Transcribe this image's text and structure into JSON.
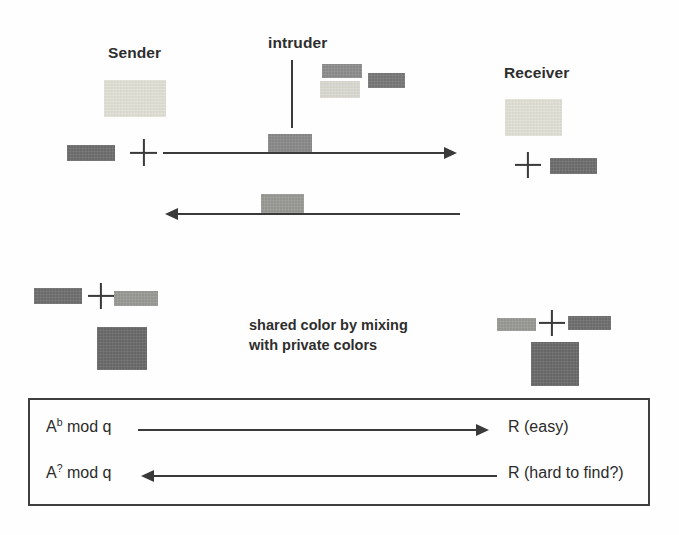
{
  "figure": {
    "labels": {
      "sender": "Sender",
      "intruder": "intruder",
      "receiver": "Receiver",
      "caption_line1": "shared color by mixing",
      "caption_line2": "with private colors"
    },
    "box": {
      "rows": [
        {
          "left": "A",
          "left_exponent": "b",
          "left_suffix": " mod q",
          "direction": "right",
          "right": "R (easy)"
        },
        {
          "left": "A",
          "left_exponent": "?",
          "left_suffix": " mod q",
          "direction": "left",
          "right": "R (hard to find?)"
        }
      ]
    },
    "colors": {
      "ink": "#3a3a3a",
      "box_border": "#3f3f3f",
      "background": "#fefefe",
      "sender_public_pale": "#e3e3d8",
      "sender_private_dark": "#6e6e6e",
      "intruder_bar_mid": "#8e8e8e",
      "intruder_bar_pale": "#dcdcd4",
      "intruder_bar_dark": "#787878",
      "transit_bar_up": "#8a8a8a",
      "transit_bar_down": "#9a9a96",
      "receiver_public_pale": "#e3e3d8",
      "receiver_private_dark": "#6e6e6e",
      "mix_left_dark": "#6f6f6f",
      "mix_left_mid": "#9a9a96",
      "mix_left_result": "#6a6a6a",
      "mix_right_mid": "#9a9a96",
      "mix_right_dark": "#6f6f6f",
      "mix_right_result": "#6a6a6a"
    },
    "swatches": [
      {
        "name": "sender-public-color-swatch",
        "x": 104,
        "y": 80,
        "w": 62,
        "h": 37,
        "color_key": "sender_public_pale"
      },
      {
        "name": "sender-private-color-swatch",
        "x": 67,
        "y": 145,
        "w": 48,
        "h": 16,
        "color_key": "sender_private_dark"
      },
      {
        "name": "intruder-captured-bar-1",
        "x": 322,
        "y": 64,
        "w": 40,
        "h": 14,
        "color_key": "intruder_bar_mid"
      },
      {
        "name": "intruder-captured-bar-2",
        "x": 320,
        "y": 81,
        "w": 40,
        "h": 17,
        "color_key": "intruder_bar_pale"
      },
      {
        "name": "intruder-captured-bar-3",
        "x": 368,
        "y": 73,
        "w": 37,
        "h": 15,
        "color_key": "intruder_bar_dark"
      },
      {
        "name": "transit-bar-outbound",
        "x": 268,
        "y": 134,
        "w": 44,
        "h": 18,
        "color_key": "transit_bar_up"
      },
      {
        "name": "transit-bar-inbound",
        "x": 261,
        "y": 194,
        "w": 43,
        "h": 19,
        "color_key": "transit_bar_down"
      },
      {
        "name": "receiver-public-color-swatch",
        "x": 505,
        "y": 99,
        "w": 57,
        "h": 37,
        "color_key": "receiver_public_pale"
      },
      {
        "name": "receiver-private-color-swatch",
        "x": 550,
        "y": 158,
        "w": 47,
        "h": 16,
        "color_key": "receiver_private_dark"
      },
      {
        "name": "mix-left-operand-a",
        "x": 34,
        "y": 288,
        "w": 48,
        "h": 16,
        "color_key": "mix_left_dark"
      },
      {
        "name": "mix-left-operand-b",
        "x": 114,
        "y": 291,
        "w": 44,
        "h": 15,
        "color_key": "mix_left_mid"
      },
      {
        "name": "mix-left-result",
        "x": 97,
        "y": 327,
        "w": 50,
        "h": 43,
        "color_key": "mix_left_result"
      },
      {
        "name": "mix-right-operand-a",
        "x": 497,
        "y": 318,
        "w": 39,
        "h": 13,
        "color_key": "mix_right_mid"
      },
      {
        "name": "mix-right-operand-b",
        "x": 568,
        "y": 316,
        "w": 43,
        "h": 14,
        "color_key": "mix_right_dark"
      },
      {
        "name": "mix-right-result",
        "x": 531,
        "y": 342,
        "w": 48,
        "h": 44,
        "color_key": "mix_right_result"
      }
    ]
  }
}
